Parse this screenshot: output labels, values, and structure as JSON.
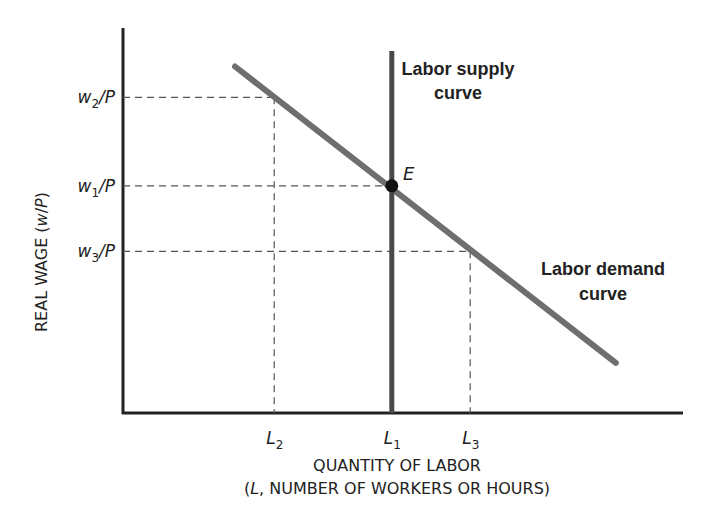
{
  "diagram": {
    "y_axis_label": "REAL WAGE (w/P)",
    "y_axis_label_parts": [
      "REAL WAGE (",
      "w",
      "/",
      "P",
      ")"
    ],
    "x_axis_label_line1": "QUANTITY OF LABOR",
    "x_axis_label_line2_parts": [
      "(",
      "L",
      ", NUMBER OF WORKERS OR HOURS)"
    ],
    "y_ticks": [
      {
        "id": "w2",
        "base": "w",
        "sub": "2",
        "suffix": "/P",
        "value": 0.82
      },
      {
        "id": "w1",
        "base": "w",
        "sub": "1",
        "suffix": "/P",
        "value": 0.59
      },
      {
        "id": "w3",
        "base": "w",
        "sub": "3",
        "suffix": "/P",
        "value": 0.42
      }
    ],
    "x_ticks": [
      {
        "id": "L2",
        "base": "L",
        "sub": "2",
        "value": 0.27
      },
      {
        "id": "L1",
        "base": "L",
        "sub": "1",
        "value": 0.48
      },
      {
        "id": "L3",
        "base": "L",
        "sub": "3",
        "value": 0.62
      }
    ],
    "curves": {
      "supply": {
        "label_line1": "Labor supply",
        "label_line2": "curve",
        "x": 0.48,
        "y_start": 0,
        "y_end": 0.94,
        "color": "#4a4a4a"
      },
      "demand": {
        "label_line1": "Labor demand",
        "label_line2": "curve",
        "start": [
          0.2,
          0.9
        ],
        "end": [
          0.88,
          0.13
        ],
        "color": "#6e6e6e"
      }
    },
    "equilibrium": {
      "label": "E",
      "x": 0.48,
      "y": 0.59
    },
    "axis_color": "#222222",
    "guide_color": "#555555"
  }
}
